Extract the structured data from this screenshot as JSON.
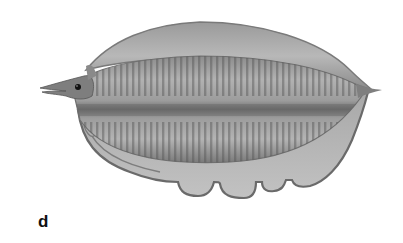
{
  "figure": {
    "panel_label": "d",
    "colors": {
      "background": "#ffffff",
      "body_light": "#b4b4b4",
      "body_mid": "#8e8e8e",
      "body_dark": "#555555",
      "outline": "#6a6a6a",
      "eye": "#111111",
      "label": "#111111"
    }
  }
}
